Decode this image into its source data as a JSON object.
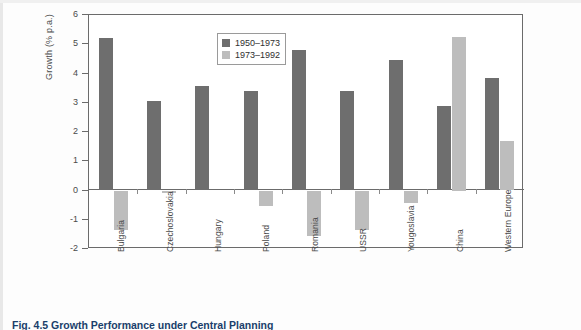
{
  "figure": {
    "caption": "Fig. 4.5 Growth Performance under Central Planning"
  },
  "chart_data": {
    "type": "bar",
    "title": "",
    "xlabel": "",
    "ylabel": "Growth (% p.a.)",
    "ylim": [
      -2,
      6
    ],
    "yticks": [
      "6",
      "5",
      "4",
      "3",
      "2",
      "1",
      "0",
      "-1",
      "-2"
    ],
    "grid": false,
    "legend_position": "top-left-inside",
    "categories": [
      "Bulgaria",
      "Czechoslovakia",
      "Hungary",
      "Poland",
      "Romania",
      "USSR",
      "Yougoslavia",
      "China",
      "Western Europe"
    ],
    "series": [
      {
        "name": "1950–1973",
        "color": "#6e6e6e",
        "values": [
          5.2,
          3.07,
          3.58,
          3.4,
          4.8,
          3.4,
          4.45,
          2.9,
          3.85
        ]
      },
      {
        "name": "1973–1992",
        "color": "#bdbdbd",
        "values": [
          -1.35,
          -0.07,
          0,
          -0.52,
          -1.55,
          -1.35,
          -0.42,
          5.25,
          1.7
        ]
      }
    ]
  }
}
